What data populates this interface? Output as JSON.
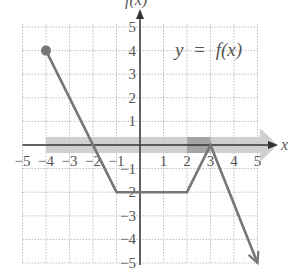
{
  "chart_data": {
    "type": "line",
    "title": "",
    "annotation": "y = f(x)",
    "xlabel": "x",
    "ylabel": "f(x)",
    "xlim": [
      -5,
      5
    ],
    "ylim": [
      -5,
      5
    ],
    "grid": true,
    "x_ticks": [
      -5,
      -4,
      -3,
      -2,
      -1,
      1,
      2,
      3,
      4,
      5
    ],
    "y_ticks": [
      5,
      4,
      3,
      2,
      1,
      -1,
      -2,
      -3,
      -4,
      -5
    ],
    "x_tick_labels": [
      "−5",
      "−4",
      "−3",
      "−2",
      "−1",
      "1",
      "2",
      "3",
      "4",
      "5"
    ],
    "y_tick_labels": [
      "5",
      "4",
      "3",
      "2",
      "1",
      "−1",
      "−2",
      "−3",
      "−4",
      "−5"
    ],
    "series": [
      {
        "name": "f(x)",
        "points": [
          [
            -4,
            4
          ],
          [
            -1,
            -2
          ],
          [
            2,
            -2
          ],
          [
            3,
            0
          ],
          [
            5,
            -5
          ]
        ],
        "start": "closed-dot",
        "end": "arrow",
        "color": "#777777"
      }
    ],
    "shaded_regions": [
      {
        "name": "domain-band",
        "x_from": -4,
        "x_to": 5.5,
        "color": "#c8c8c8",
        "note": "light band along x-axis ending in arrow"
      },
      {
        "name": "interval-2-3",
        "x_from": 2,
        "x_to": 3,
        "color": "#9a9a9a"
      }
    ]
  },
  "labels": {
    "y_axis": "f(x)",
    "x_axis": "x",
    "function_y": "y",
    "function_eq": "=",
    "function_f": "f(x)"
  },
  "colors": {
    "grid": "#bfbfbf",
    "axis": "#333333",
    "curve": "#777777",
    "band_light": "#c8c8c8",
    "band_dark": "#9a9a9a"
  }
}
